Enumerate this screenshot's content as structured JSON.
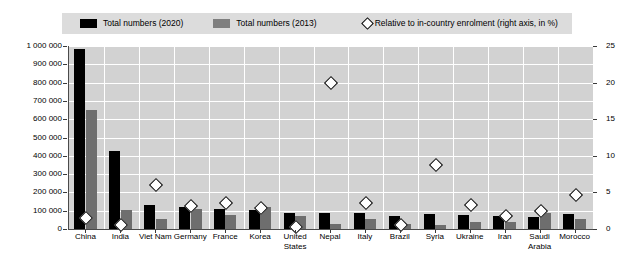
{
  "chart_data": {
    "type": "bar",
    "title": "",
    "subtitle": "",
    "xlabel": "",
    "ylabel": "",
    "ylim": [
      0,
      1000000
    ],
    "y2lim": [
      0,
      25
    ],
    "y_ticks": [
      "0",
      "100 000",
      "200 000",
      "300 000",
      "400 000",
      "500 000",
      "600 000",
      "700 000",
      "800 000",
      "900 000",
      "1 000 000"
    ],
    "y2_ticks": [
      "0",
      "5",
      "10",
      "15",
      "20",
      "25"
    ],
    "grid": true,
    "legend_position": "top",
    "categories": [
      "China",
      "India",
      "Viet Nam",
      "Germany",
      "France",
      "Korea",
      "United States",
      "Nepal",
      "Italy",
      "Brazil",
      "Syria",
      "Ukraine",
      "Iran",
      "Saudi Arabia",
      "Morocco"
    ],
    "series": [
      {
        "name": "Total numbers (2020)",
        "type": "bar",
        "axis": "left",
        "color": "#000000",
        "values": [
          985000,
          425000,
          130000,
          120000,
          110000,
          105000,
          85000,
          90000,
          85000,
          70000,
          80000,
          75000,
          70000,
          65000,
          80000
        ]
      },
      {
        "name": "Total numbers (2013)",
        "type": "bar",
        "axis": "left",
        "color": "#6e6e6e",
        "values": [
          650000,
          105000,
          55000,
          110000,
          75000,
          120000,
          70000,
          25000,
          55000,
          30000,
          20000,
          40000,
          40000,
          85000,
          55000
        ]
      },
      {
        "name": "Relative to in-country enrolment (right axis, in %)",
        "type": "scatter",
        "axis": "right",
        "marker": "diamond",
        "color": "#ffffff",
        "edge_color": "#000000",
        "values": [
          1.5,
          0.6,
          6.0,
          3.2,
          3.6,
          2.9,
          0.3,
          20.0,
          3.5,
          0.5,
          8.7,
          3.3,
          1.8,
          2.5,
          4.7
        ]
      }
    ]
  },
  "legend": {
    "entries": [
      {
        "label": "Total numbers (2020)",
        "marker": "square-black"
      },
      {
        "label": "Total numbers (2013)",
        "marker": "square-gray"
      },
      {
        "label": "Relative to in-country enrolment (right axis, in %)",
        "marker": "diamond-open"
      }
    ]
  },
  "colors": {
    "bar_2020": "#000000",
    "bar_2013": "#6e6e6e",
    "plot_background": "#d2d2d2",
    "legend_background": "#dcdcdc",
    "gridline": "#ffffff",
    "axis": "#4a4a4a"
  }
}
